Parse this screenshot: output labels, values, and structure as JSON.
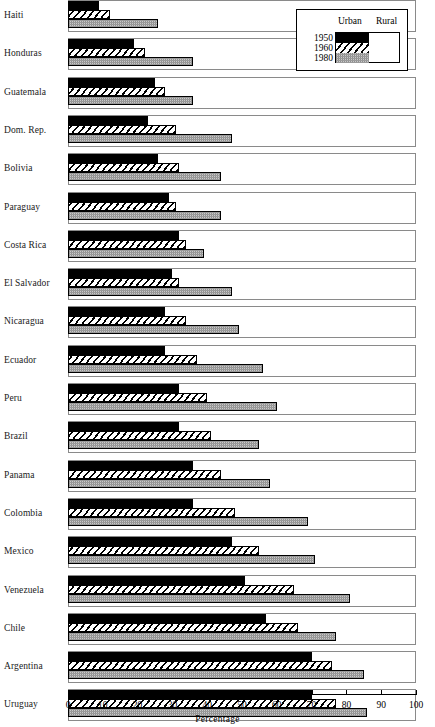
{
  "chart_data": {
    "type": "bar",
    "orientation": "horizontal",
    "title": "",
    "xlabel": "Percentage",
    "ylabel": "",
    "xlim": [
      0,
      100
    ],
    "xticks": [
      0,
      10,
      20,
      30,
      40,
      50,
      60,
      70,
      80,
      90,
      100
    ],
    "grid": false,
    "legend_position": "top-right",
    "legend_headers": [
      "Urban",
      "Rural"
    ],
    "series": [
      {
        "name": "1950",
        "fill": "solid-black",
        "values": [
          9,
          19,
          25,
          23,
          26,
          29,
          32,
          30,
          28,
          28,
          32,
          32,
          36,
          36,
          47,
          51,
          57,
          70,
          70
        ]
      },
      {
        "name": "1960",
        "fill": "diagonal-hatch",
        "values": [
          12,
          22,
          28,
          31,
          32,
          31,
          34,
          32,
          34,
          37,
          40,
          41,
          44,
          48,
          55,
          65,
          66,
          76,
          77
        ]
      },
      {
        "name": "1980",
        "fill": "gray-dither",
        "values": [
          26,
          36,
          36,
          47,
          44,
          44,
          39,
          47,
          49,
          56,
          60,
          55,
          58,
          69,
          71,
          81,
          77,
          85,
          86
        ]
      }
    ],
    "categories": [
      "Haiti",
      "Honduras",
      "Guatemala",
      "Dom. Rep.",
      "Bolivia",
      "Paraguay",
      "Costa Rica",
      "El Salvador",
      "Nicaragua",
      "Ecuador",
      "Peru",
      "Brazil",
      "Panama",
      "Colombia",
      "Mexico",
      "Venezuela",
      "Chile",
      "Argentina",
      "Uruguay"
    ],
    "rows": [
      {
        "country": "Haiti",
        "1950": 9,
        "1960": 12,
        "1980": 26
      },
      {
        "country": "Honduras",
        "1950": 19,
        "1960": 22,
        "1980": 36
      },
      {
        "country": "Guatemala",
        "1950": 25,
        "1960": 28,
        "1980": 36
      },
      {
        "country": "Dom. Rep.",
        "1950": 23,
        "1960": 31,
        "1980": 47
      },
      {
        "country": "Bolivia",
        "1950": 26,
        "1960": 32,
        "1980": 44
      },
      {
        "country": "Paraguay",
        "1950": 29,
        "1960": 31,
        "1980": 44
      },
      {
        "country": "Costa Rica",
        "1950": 32,
        "1960": 34,
        "1980": 39
      },
      {
        "country": "El Salvador",
        "1950": 30,
        "1960": 32,
        "1980": 47
      },
      {
        "country": "Nicaragua",
        "1950": 28,
        "1960": 34,
        "1980": 49
      },
      {
        "country": "Ecuador",
        "1950": 28,
        "1960": 37,
        "1980": 56
      },
      {
        "country": "Peru",
        "1950": 32,
        "1960": 40,
        "1980": 60
      },
      {
        "country": "Brazil",
        "1950": 32,
        "1960": 41,
        "1980": 55
      },
      {
        "country": "Panama",
        "1950": 36,
        "1960": 44,
        "1980": 58
      },
      {
        "country": "Colombia",
        "1950": 36,
        "1960": 48,
        "1980": 69
      },
      {
        "country": "Mexico",
        "1950": 47,
        "1960": 55,
        "1980": 71
      },
      {
        "country": "Venezuela",
        "1950": 51,
        "1960": 65,
        "1980": 81
      },
      {
        "country": "Chile",
        "1950": 57,
        "1960": 66,
        "1980": 77
      },
      {
        "country": "Argentina",
        "1950": 70,
        "1960": 76,
        "1980": 85
      },
      {
        "country": "Uruguay",
        "1950": 70,
        "1960": 77,
        "1980": 86
      }
    ]
  },
  "legend": {
    "urban_label": "Urban",
    "rural_label": "Rural",
    "years": [
      "1950",
      "1960",
      "1980"
    ]
  },
  "axis": {
    "title": "Percentage",
    "ticks": [
      "0",
      "10",
      "20",
      "30",
      "40",
      "50",
      "60",
      "70",
      "80",
      "90",
      "100"
    ]
  },
  "colors": {
    "solid": "#000000",
    "hatch_line": "#000000",
    "dither_gray": "#c9c9c9",
    "outline": "#8a8a8a",
    "text": "#1a1a1a"
  }
}
